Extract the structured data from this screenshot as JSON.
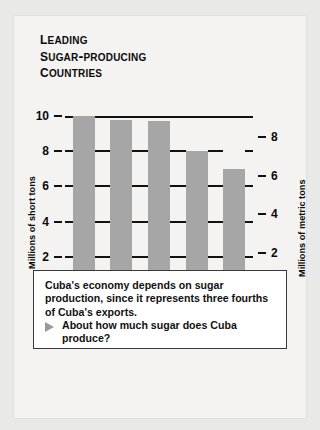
{
  "title_lines": [
    "Leading",
    "Sugar-Producing",
    "Countries"
  ],
  "chart_data": {
    "type": "bar",
    "title": "Leading Sugar-Producing Countries",
    "categories": [
      "India",
      "Brazil",
      "Soviet Union",
      "Cuba",
      "United States"
    ],
    "category_lines": [
      [
        "India"
      ],
      [
        "Brazil"
      ],
      [
        "Soviet",
        "Union"
      ],
      [
        "Cuba"
      ],
      [
        "United",
        "States"
      ]
    ],
    "values": [
      10.0,
      9.8,
      9.7,
      8.0,
      7.0
    ],
    "ylabel": "Millions of short tons",
    "y2label": "Millions of metric tons",
    "xlabel": "",
    "ylim": [
      0,
      10
    ],
    "yticks": [
      0,
      2,
      4,
      6,
      8,
      10
    ],
    "y2lim": [
      0,
      9.07
    ],
    "y2ticks": [
      0,
      2,
      4,
      6,
      8
    ],
    "grid": true,
    "legend": "none",
    "bar_color": "#a6a6a6",
    "axis_color": "#111111"
  },
  "caption": {
    "body": "Cuba's economy depends on sugar production, since it represents three fourths of Cuba's exports.",
    "question": "About how much sugar does Cuba produce?",
    "bullet": "triangle-right-marker"
  }
}
